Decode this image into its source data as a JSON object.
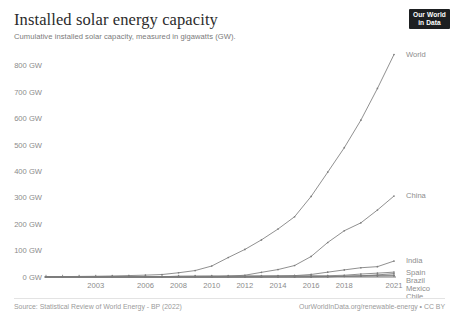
{
  "header": {
    "title": "Installed solar energy capacity",
    "subtitle": "Cumulative installed solar capacity, measured in gigawatts (GW).",
    "logo_line1": "Our World",
    "logo_line2": "in Data"
  },
  "footer": {
    "source": "Source: Statistical Review of World Energy - BP (2022)",
    "credit": "OurWorldInData.org/renewable-energy • CC BY"
  },
  "chart_data": {
    "type": "line",
    "title": "Installed solar energy capacity",
    "subtitle": "Cumulative installed solar capacity, measured in gigawatts (GW).",
    "xlabel": "",
    "ylabel": "GW",
    "xlim": [
      2000,
      2021
    ],
    "ylim": [
      0,
      845
    ],
    "grid": false,
    "legend_position": "right-inline",
    "y_ticks": [
      0,
      100,
      200,
      300,
      400,
      500,
      600,
      700,
      800
    ],
    "y_tick_labels": [
      "0 GW",
      "100 GW",
      "200 GW",
      "300 GW",
      "400 GW",
      "500 GW",
      "600 GW",
      "700 GW",
      "800 GW"
    ],
    "x_ticks": [
      2003,
      2006,
      2008,
      2010,
      2012,
      2014,
      2016,
      2018,
      2021
    ],
    "x_tick_labels": [
      "2003",
      "2006",
      "2008",
      "2010",
      "2012",
      "2014",
      "2016",
      "2018",
      "2021"
    ],
    "x": [
      2000,
      2001,
      2002,
      2003,
      2004,
      2005,
      2006,
      2007,
      2008,
      2009,
      2010,
      2011,
      2012,
      2013,
      2014,
      2015,
      2016,
      2017,
      2018,
      2019,
      2020,
      2021
    ],
    "series": [
      {
        "name": "World",
        "color": "#7c7c7c",
        "label": "World",
        "values": [
          1.2,
          1.6,
          2.1,
          2.8,
          3.9,
          5.4,
          7.0,
          9.4,
          16.1,
          24.4,
          41.6,
          73.9,
          104.4,
          140.6,
          181.8,
          228.3,
          305.4,
          397.1,
          489.9,
          594.3,
          714.5,
          843.1
        ]
      },
      {
        "name": "China",
        "color": "#7c7c7c",
        "label": "China",
        "values": [
          0.02,
          0.03,
          0.04,
          0.05,
          0.06,
          0.07,
          0.08,
          0.1,
          0.14,
          0.3,
          0.8,
          3.1,
          6.7,
          17.7,
          28.2,
          43.5,
          77.8,
          130.8,
          175.3,
          205.2,
          253.8,
          306.9
        ]
      },
      {
        "name": "India",
        "color": "#7c7c7c",
        "label": "India",
        "values": [
          0.0,
          0.0,
          0.0,
          0.0,
          0.0,
          0.0,
          0.0,
          0.01,
          0.02,
          0.03,
          0.06,
          0.5,
          1.2,
          2.3,
          3.3,
          5.1,
          9.6,
          18.3,
          26.9,
          35.1,
          39.2,
          60.4
        ]
      },
      {
        "name": "Spain",
        "color": "#7c7c7c",
        "label": "Spain",
        "values": [
          0.01,
          0.02,
          0.02,
          0.03,
          0.04,
          0.06,
          0.15,
          0.7,
          3.4,
          3.9,
          4.2,
          4.4,
          4.6,
          4.7,
          4.8,
          4.9,
          4.9,
          4.9,
          6.6,
          11.2,
          14.6,
          18.5
        ]
      },
      {
        "name": "Brazil",
        "color": "#7c7c7c",
        "label": "Brazil",
        "values": [
          0.0,
          0.0,
          0.0,
          0.0,
          0.0,
          0.0,
          0.0,
          0.0,
          0.0,
          0.0,
          0.0,
          0.0,
          0.01,
          0.01,
          0.02,
          0.03,
          0.08,
          1.1,
          2.4,
          4.5,
          7.9,
          13.0
        ]
      },
      {
        "name": "Mexico",
        "color": "#7c7c7c",
        "label": "Mexico",
        "values": [
          0.0,
          0.0,
          0.0,
          0.0,
          0.0,
          0.0,
          0.0,
          0.0,
          0.02,
          0.03,
          0.03,
          0.04,
          0.06,
          0.09,
          0.17,
          0.27,
          0.39,
          0.54,
          3.0,
          4.4,
          6.2,
          7.0
        ]
      },
      {
        "name": "Chile",
        "color": "#7c7c7c",
        "label": "Chile",
        "values": [
          0.0,
          0.0,
          0.0,
          0.0,
          0.0,
          0.0,
          0.0,
          0.0,
          0.0,
          0.0,
          0.0,
          0.0,
          0.01,
          0.22,
          0.62,
          0.85,
          1.6,
          2.1,
          2.6,
          3.2,
          3.9,
          4.7
        ]
      }
    ]
  }
}
